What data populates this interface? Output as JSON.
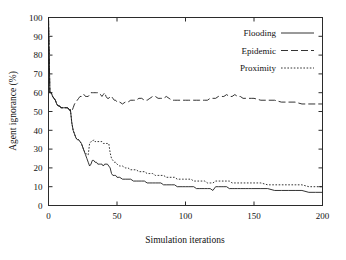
{
  "chart_data": {
    "type": "line",
    "title": "",
    "xlabel": "Simulation iterations",
    "ylabel": "Agent ignorance (%)",
    "xlim": [
      0,
      200
    ],
    "ylim": [
      0,
      100
    ],
    "xticks": [
      0,
      50,
      100,
      150,
      200
    ],
    "yticks": [
      0,
      10,
      20,
      30,
      40,
      50,
      60,
      70,
      80,
      90,
      100
    ],
    "xtick_labels": [
      "0",
      "50",
      "100",
      "150",
      "200"
    ],
    "ytick_labels": [
      "0",
      "10",
      "20",
      "30",
      "40",
      "50",
      "60",
      "70",
      "80",
      "90",
      "100"
    ],
    "grid": false,
    "legend_position": "top-right",
    "x": [
      0,
      1,
      2,
      3,
      4,
      5,
      6,
      7,
      8,
      9,
      10,
      11,
      12,
      13,
      14,
      15,
      16,
      17,
      18,
      19,
      20,
      21,
      22,
      23,
      24,
      25,
      26,
      27,
      28,
      29,
      30,
      31,
      32,
      33,
      34,
      35,
      36,
      37,
      38,
      39,
      40,
      41,
      42,
      43,
      44,
      45,
      46,
      47,
      48,
      49,
      50,
      52,
      54,
      56,
      58,
      60,
      62,
      64,
      66,
      68,
      70,
      72,
      74,
      76,
      78,
      80,
      82,
      84,
      86,
      88,
      90,
      92,
      94,
      96,
      98,
      100,
      102,
      104,
      106,
      108,
      110,
      112,
      114,
      116,
      118,
      120,
      122,
      124,
      126,
      128,
      130,
      132,
      134,
      136,
      138,
      140,
      142,
      144,
      146,
      148,
      150,
      155,
      160,
      165,
      170,
      175,
      180,
      185,
      190,
      195,
      200
    ],
    "series": [
      {
        "name": "Flooding",
        "style": "solid",
        "color": "#1d1d1d",
        "values": [
          100,
          60,
          60,
          58,
          57,
          56,
          54,
          53,
          53,
          52,
          52,
          52,
          52,
          52,
          52,
          51,
          51,
          44,
          40,
          38,
          36,
          35,
          35,
          34,
          33,
          31,
          29,
          27,
          25,
          23,
          21,
          22,
          24,
          24,
          23,
          23,
          22,
          22,
          22,
          22,
          21,
          22,
          22,
          22,
          21,
          20,
          17,
          16,
          16,
          16,
          15,
          15,
          14,
          14,
          14,
          14,
          13,
          13,
          13,
          13,
          13,
          12,
          12,
          12,
          12,
          12,
          12,
          11,
          11,
          11,
          11,
          11,
          10,
          10,
          10,
          10,
          10,
          10,
          10,
          9,
          9,
          9,
          9,
          9,
          9,
          8,
          10,
          10,
          10,
          10,
          10,
          9,
          9,
          9,
          9,
          9,
          9,
          9,
          9,
          9,
          9,
          9,
          9,
          8,
          8,
          8,
          8,
          8,
          7,
          7,
          7
        ]
      },
      {
        "name": "Epidemic",
        "style": "longdash",
        "color": "#4a4a4a",
        "values": [
          100,
          60,
          60,
          58,
          57,
          56,
          54,
          53,
          53,
          52,
          52,
          52,
          52,
          52,
          52,
          51,
          50,
          50,
          52,
          54,
          55,
          56,
          57,
          58,
          58,
          59,
          59,
          58,
          58,
          58,
          59,
          60,
          60,
          60,
          60,
          60,
          60,
          60,
          59,
          58,
          59,
          60,
          58,
          57,
          57,
          58,
          58,
          57,
          56,
          56,
          55,
          55,
          54,
          55,
          55,
          56,
          56,
          56,
          57,
          57,
          56,
          56,
          57,
          58,
          58,
          57,
          57,
          57,
          58,
          57,
          56,
          56,
          56,
          56,
          56,
          56,
          56,
          56,
          56,
          56,
          56,
          56,
          56,
          56,
          57,
          57,
          57,
          58,
          58,
          58,
          59,
          58,
          58,
          59,
          58,
          58,
          57,
          57,
          57,
          57,
          57,
          56,
          56,
          56,
          55,
          55,
          55,
          54,
          54,
          54,
          54
        ]
      },
      {
        "name": "Proximity",
        "style": "dotted",
        "color": "#2b2b2b",
        "values": [
          100,
          60,
          60,
          58,
          57,
          56,
          54,
          53,
          53,
          52,
          52,
          52,
          52,
          52,
          52,
          51,
          51,
          44,
          40,
          38,
          36,
          35,
          35,
          34,
          33,
          31,
          29,
          28,
          27,
          27,
          33,
          34,
          34,
          35,
          34,
          34,
          34,
          34,
          34,
          34,
          33,
          33,
          33,
          33,
          33,
          28,
          25,
          24,
          23,
          23,
          22,
          21,
          21,
          20,
          20,
          19,
          19,
          19,
          18,
          18,
          18,
          17,
          17,
          17,
          16,
          16,
          16,
          16,
          15,
          15,
          15,
          15,
          14,
          14,
          14,
          14,
          14,
          14,
          13,
          13,
          13,
          13,
          13,
          12,
          12,
          12,
          13,
          13,
          13,
          13,
          13,
          13,
          12,
          12,
          12,
          12,
          12,
          12,
          12,
          12,
          12,
          12,
          11,
          11,
          11,
          11,
          11,
          11,
          10,
          10,
          10
        ]
      }
    ]
  },
  "legend": {
    "items": [
      {
        "label": "Flooding",
        "style": "solid"
      },
      {
        "label": "Epidemic",
        "style": "longdash"
      },
      {
        "label": "Proximity",
        "style": "dotted"
      }
    ]
  }
}
